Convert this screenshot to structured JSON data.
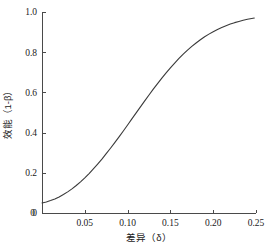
{
  "chart_data": {
    "type": "line",
    "title": "",
    "subtitle": "",
    "xlabel": "差异（δ）",
    "ylabel": "效能（1-β）",
    "xlim": [
      0,
      0.25
    ],
    "ylim": [
      0,
      1.0
    ],
    "grid": false,
    "legend": null,
    "x_ticks": [
      {
        "value": 0,
        "label": "0"
      },
      {
        "value": 0.05,
        "label": "0.05"
      },
      {
        "value": 0.1,
        "label": "0.10"
      },
      {
        "value": 0.15,
        "label": "0.15"
      },
      {
        "value": 0.2,
        "label": "0.20"
      },
      {
        "value": 0.25,
        "label": "0.25"
      }
    ],
    "y_ticks": [
      {
        "value": 0,
        "label": "0"
      },
      {
        "value": 0.2,
        "label": "0.2"
      },
      {
        "value": 0.4,
        "label": "0.4"
      },
      {
        "value": 0.6,
        "label": "0.6"
      },
      {
        "value": 0.8,
        "label": "0.8"
      },
      {
        "value": 1.0,
        "label": "1.0"
      }
    ],
    "series": [
      {
        "name": "power-curve",
        "color": "#3a3a3a",
        "x": [
          0.0,
          0.005,
          0.01,
          0.015,
          0.02,
          0.025,
          0.03,
          0.035,
          0.04,
          0.045,
          0.05,
          0.055,
          0.06,
          0.065,
          0.07,
          0.075,
          0.08,
          0.085,
          0.09,
          0.095,
          0.1,
          0.105,
          0.11,
          0.115,
          0.12,
          0.125,
          0.13,
          0.135,
          0.14,
          0.145,
          0.15,
          0.155,
          0.16,
          0.165,
          0.17,
          0.175,
          0.18,
          0.185,
          0.19,
          0.195,
          0.2,
          0.205,
          0.21,
          0.215,
          0.22,
          0.225,
          0.23,
          0.235,
          0.24,
          0.245,
          0.248
        ],
        "y": [
          0.05,
          0.055,
          0.062,
          0.07,
          0.08,
          0.092,
          0.105,
          0.12,
          0.137,
          0.155,
          0.175,
          0.196,
          0.219,
          0.243,
          0.268,
          0.295,
          0.322,
          0.35,
          0.379,
          0.408,
          0.438,
          0.468,
          0.498,
          0.528,
          0.558,
          0.587,
          0.616,
          0.644,
          0.671,
          0.697,
          0.722,
          0.746,
          0.769,
          0.79,
          0.81,
          0.829,
          0.846,
          0.862,
          0.877,
          0.89,
          0.902,
          0.913,
          0.923,
          0.932,
          0.94,
          0.947,
          0.953,
          0.959,
          0.964,
          0.968,
          0.97
        ]
      }
    ],
    "colors": {
      "curve": "#3a3a3a",
      "axis": "#4a4a4a",
      "text": "#1a1a1a",
      "background": "#ffffff"
    },
    "geometry": {
      "plot_left": 42,
      "plot_right": 256,
      "plot_top": 12,
      "plot_bottom": 213,
      "tick_length": 3.5
    }
  }
}
